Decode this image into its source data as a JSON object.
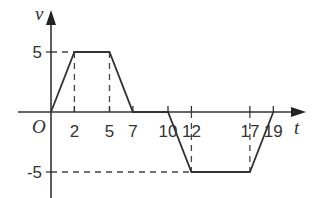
{
  "chart_data": {
    "type": "line",
    "title": "",
    "xlabel": "t",
    "ylabel": "v",
    "origin_label": "O",
    "x": [
      0,
      2,
      5,
      7,
      10,
      12,
      17,
      19
    ],
    "y": [
      0,
      5,
      5,
      0,
      0,
      -5,
      -5,
      0
    ],
    "x_tick_labels": [
      "2",
      "5",
      "7",
      "10",
      "12",
      "17",
      "19"
    ],
    "y_tick_labels": [
      "5",
      "-5"
    ],
    "xlim": [
      0,
      20
    ],
    "ylim": [
      -6,
      8
    ],
    "grid": false,
    "guide_lines": "dashed verticals at t=2,5,12,17 and dashed horizontals at v=5, v=-5",
    "line_color": "#333333"
  }
}
